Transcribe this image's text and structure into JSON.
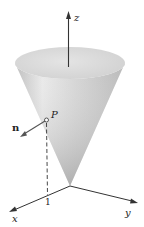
{
  "figure": {
    "labels": {
      "z_axis": "z",
      "x_axis": "x",
      "y_axis": "y",
      "point": "P",
      "normal": "n",
      "tick": "1"
    },
    "colors": {
      "cone_light": "#e6e6e6",
      "cone_mid": "#cfcfcf",
      "cone_dark": "#a8a8a8",
      "top_face": "#dcdcdc",
      "axis": "#333333",
      "text": "#222222"
    }
  }
}
